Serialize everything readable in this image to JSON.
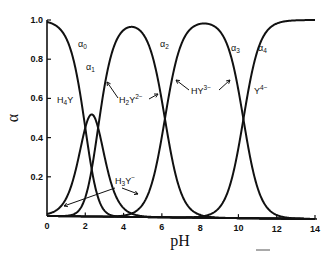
{
  "chart_data": {
    "type": "line",
    "title": "",
    "xlabel": "pH",
    "ylabel": "α",
    "xlim": [
      0,
      14
    ],
    "ylim": [
      0,
      1.0
    ],
    "x_ticks": [
      "0",
      "2",
      "4",
      "6",
      "8",
      "10",
      "12",
      "14"
    ],
    "y_ticks": [
      "0.2",
      "0.4",
      "0.6",
      "0.8",
      "1.0"
    ],
    "grid": false,
    "pKa": [
      2.0,
      2.67,
      6.16,
      10.26
    ],
    "series": [
      {
        "name": "α0",
        "species": "H4Y"
      },
      {
        "name": "α1",
        "species": "H3Y−"
      },
      {
        "name": "α2",
        "species": "H2Y2−"
      },
      {
        "name": "α3",
        "species": "HY3−"
      },
      {
        "name": "α4",
        "species": "Y4−"
      }
    ],
    "annotations": [
      {
        "text": "α0",
        "base": "α",
        "sub": "0"
      },
      {
        "text": "α1",
        "base": "α",
        "sub": "1"
      },
      {
        "text": "α2",
        "base": "α",
        "sub": "2"
      },
      {
        "text": "α3",
        "base": "α",
        "sub": "3"
      },
      {
        "text": "α4",
        "base": "α",
        "sub": "4"
      },
      {
        "text": "H4Y",
        "base": "H",
        "sub": "4",
        "rest": "Y"
      },
      {
        "text": "H2Y2−",
        "base": "H",
        "sub": "2",
        "rest": "Y",
        "sup": "2−"
      },
      {
        "text": "HY3−",
        "base": "HY",
        "sup": "3−"
      },
      {
        "text": "Y4−",
        "base": "Y",
        "sup": "4−"
      },
      {
        "text": "H3Y−",
        "base": "H",
        "sub": "3",
        "rest": "Y",
        "sup": "−"
      }
    ]
  }
}
